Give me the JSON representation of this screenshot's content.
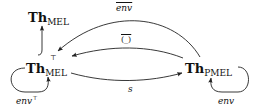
{
  "nodes": {
    "th_mel": {
      "base": "Th",
      "sub": "MEL",
      "sup": ""
    },
    "th_mel_top": {
      "base": "Th",
      "sub": "MEL",
      "sup": "⊤"
    },
    "th_pmel": {
      "base": "Th",
      "sub": "PMEL",
      "sup": ""
    }
  },
  "edges": {
    "env_bar": {
      "label": "env",
      "from": "Th_PMEL",
      "to": "Th_MEL^⊤",
      "overline": true
    },
    "paren_bar": {
      "label": "(_)",
      "from": "Th_PMEL",
      "to": "Th_MEL^⊤",
      "overline": true
    },
    "s": {
      "label": "s",
      "from": "Th_MEL^⊤",
      "to": "Th_PMEL"
    },
    "inclusion": {
      "label": "",
      "from": "Th_MEL^⊤",
      "to": "Th_MEL"
    },
    "env_top_loop": {
      "label": "env",
      "label_sup": "⊤",
      "on": "Th_MEL^⊤"
    },
    "env_loop": {
      "label": "env",
      "on": "Th_PMEL"
    }
  },
  "colors": {
    "stroke": "#222222",
    "background": "#ffffff"
  }
}
